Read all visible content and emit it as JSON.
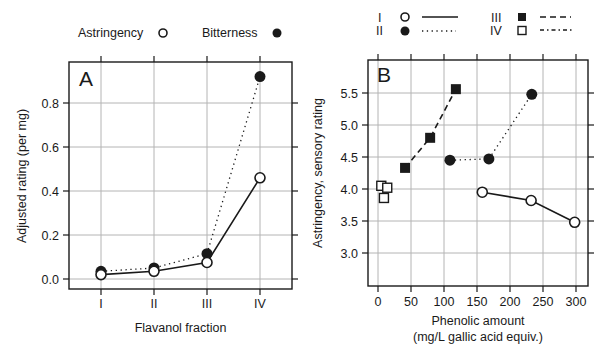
{
  "chart_data": [
    {
      "panel": "A",
      "type": "line",
      "title": "",
      "panel_label": "A",
      "xlabel": "Flavanol fraction",
      "ylabel": "Adjusted rating (per mg)",
      "categories": [
        "I",
        "II",
        "III",
        "IV"
      ],
      "ylim": [
        -0.015,
        0.97
      ],
      "yticks": [
        0.0,
        0.2,
        0.4,
        0.6,
        0.8
      ],
      "ytick_labels": [
        "0.0",
        "0.2",
        "0.4",
        "0.6",
        "0.8"
      ],
      "grid": true,
      "legend_position": "top",
      "series": [
        {
          "name": "Astringency",
          "marker": "open-circle",
          "line": "solid",
          "values": [
            0.02,
            0.035,
            0.075,
            0.46
          ]
        },
        {
          "name": "Bitterness",
          "marker": "filled-circle",
          "line": "dotted",
          "values": [
            0.035,
            0.05,
            0.115,
            0.92
          ]
        }
      ]
    },
    {
      "panel": "B",
      "type": "scatter",
      "title": "",
      "panel_label": "B",
      "xlabel": "Phenolic amount",
      "xlabel_line2": "(mg/L gallic acid equiv.)",
      "ylabel": "Astringency, sensory rating",
      "xlim": [
        -15,
        320
      ],
      "ylim": [
        2.5,
        5.95
      ],
      "xticks": [
        0,
        50,
        100,
        150,
        200,
        250,
        300
      ],
      "xtick_labels": [
        "0",
        "50",
        "100",
        "150",
        "200",
        "250",
        "300"
      ],
      "yticks": [
        3.0,
        3.5,
        4.0,
        4.5,
        5.0,
        5.5
      ],
      "ytick_labels": [
        "3.0",
        "3.5",
        "4.0",
        "4.5",
        "5.0",
        "5.5"
      ],
      "grid": true,
      "legend_position": "top",
      "series": [
        {
          "name": "I",
          "marker": "open-circle",
          "line": "solid",
          "x": [
            158,
            232,
            298
          ],
          "y": [
            3.95,
            3.82,
            3.48
          ]
        },
        {
          "name": "II",
          "marker": "filled-circle",
          "line": "dotted",
          "x": [
            109,
            168,
            233
          ],
          "y": [
            4.45,
            4.47,
            5.48
          ]
        },
        {
          "name": "III",
          "marker": "filled-square",
          "line": "dashed",
          "x": [
            41,
            79,
            118
          ],
          "y": [
            4.33,
            4.8,
            5.56
          ]
        },
        {
          "name": "IV",
          "marker": "open-square",
          "line": "dash-dot",
          "x": [
            5,
            14,
            9
          ],
          "y": [
            4.05,
            4.02,
            3.86
          ]
        }
      ]
    }
  ],
  "legend_a": {
    "items": [
      {
        "label": "Astringency",
        "marker": "open-circle"
      },
      {
        "label": "Bitterness",
        "marker": "filled-circle"
      }
    ]
  },
  "legend_b": {
    "items": [
      {
        "label": "I",
        "marker": "open-circle",
        "line": "solid"
      },
      {
        "label": "II",
        "marker": "filled-circle",
        "line": "dotted"
      },
      {
        "label": "III",
        "marker": "filled-square",
        "line": "dashed"
      },
      {
        "label": "IV",
        "marker": "open-square",
        "line": "dash-dot"
      }
    ]
  },
  "colors": {
    "ink": "#1a1a1a",
    "grid": "#b4b4b4",
    "background": "#ffffff"
  }
}
